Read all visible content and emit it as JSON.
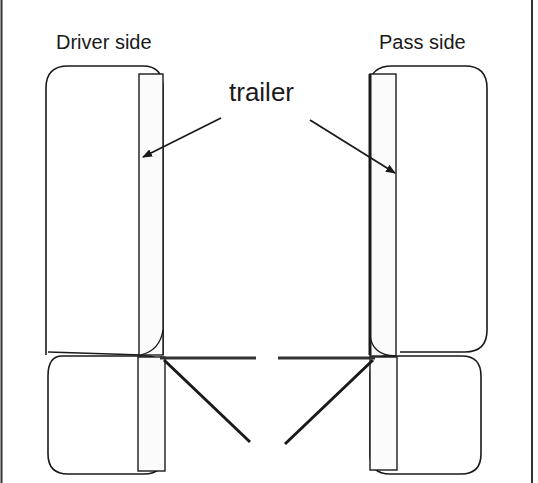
{
  "diagram": {
    "labels": {
      "driver_side": "Driver side",
      "pass_side": "Pass side",
      "trailer": "trailer"
    },
    "colors": {
      "background": "#ffffff",
      "stroke": "#1a1a1a",
      "frame": "#333333"
    },
    "components": [
      "driver-side-upper-seat",
      "driver-side-lower-seat",
      "pass-side-upper-seat",
      "pass-side-lower-seat",
      "trailer-strip-driver",
      "trailer-strip-pass",
      "horizontal-bar",
      "diagonal-bars"
    ]
  }
}
